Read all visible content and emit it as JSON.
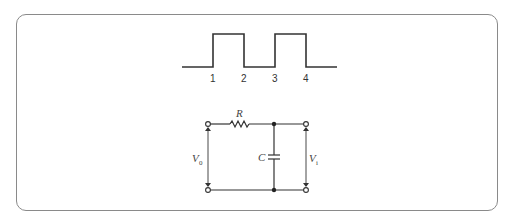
{
  "figure": {
    "waveform": {
      "type": "square-pulse-train",
      "tick_labels": [
        "1",
        "2",
        "3",
        "4"
      ]
    },
    "circuit": {
      "resistor_label": "R",
      "capacitor_label": "C",
      "input_voltage_label": "V",
      "input_voltage_sub": "0",
      "output_voltage_label": "V",
      "output_voltage_sub": "i"
    }
  }
}
